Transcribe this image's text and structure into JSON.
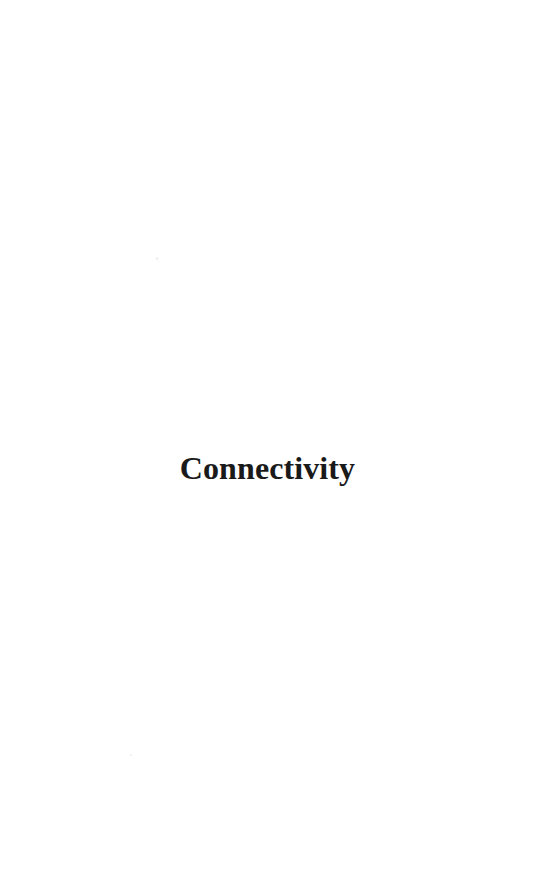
{
  "document": {
    "type": "scanned-book-part-title-page",
    "page_background_color": "#ffffff",
    "ink_color": "#1a1a1a",
    "part_title": "Connectivity"
  }
}
